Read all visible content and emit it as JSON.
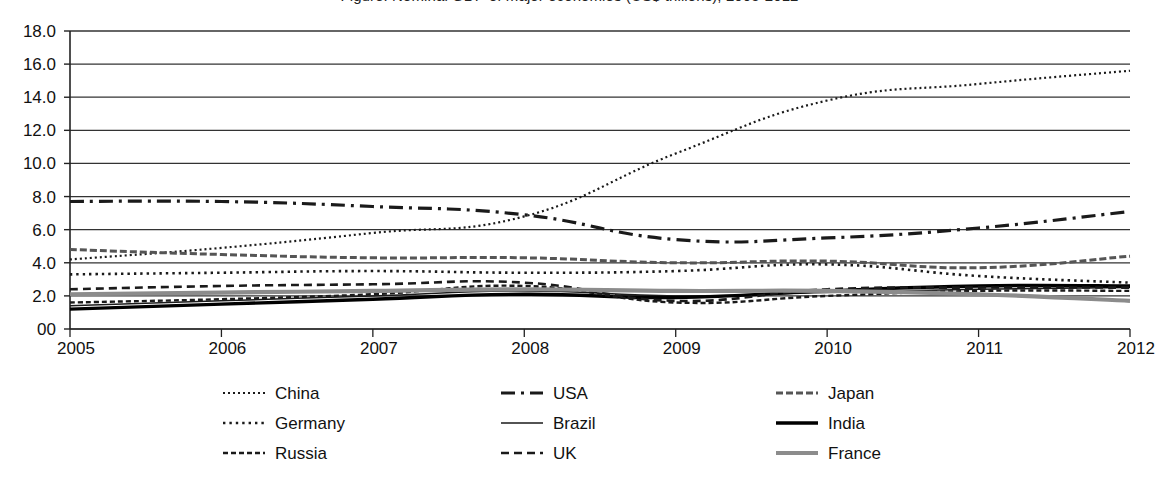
{
  "chart": {
    "title": "Figure: Nominal GDP of major economies (US$ trillions), 2005-2012",
    "yaxis": {
      "labels": [
        "18.0",
        "16.0",
        "14.0",
        "12.0",
        "10.0",
        "8.0",
        "6.0",
        "4.0",
        "2.0",
        "00"
      ],
      "values": [
        18,
        16,
        14,
        12,
        10,
        8,
        6,
        4,
        2,
        0
      ]
    },
    "xaxis": {
      "labels": [
        "2005",
        "2006",
        "2007",
        "2008",
        "2009",
        "2010",
        "2011",
        "2012"
      ]
    },
    "legend": {
      "columns": [
        {
          "items": [
            {
              "label": "China",
              "style": "fine-dotted",
              "color": "#1a1a1a"
            },
            {
              "label": "Germany",
              "style": "dotted",
              "color": "#1a1a1a"
            },
            {
              "label": "Russia",
              "style": "dash-short",
              "color": "#1a1a1a"
            }
          ]
        },
        {
          "items": [
            {
              "label": "USA",
              "style": "dash-dot",
              "color": "#1a1a1a"
            },
            {
              "label": "Brazil",
              "style": "solid-thin",
              "color": "#1a1a1a"
            },
            {
              "label": "UK",
              "style": "dashed",
              "color": "#1a1a1a"
            }
          ]
        },
        {
          "items": [
            {
              "label": "Japan",
              "style": "fine-dashed",
              "color": "#555555"
            },
            {
              "label": "India",
              "style": "solid-thick",
              "color": "#000000"
            },
            {
              "label": "France",
              "style": "solid-gray-thick",
              "color": "#8c8c8c"
            }
          ]
        }
      ]
    }
  },
  "chart_data": {
    "type": "line",
    "title": "Figure: Nominal GDP of major economies (US$ trillions), 2005-2012",
    "xlabel": "",
    "ylabel": "",
    "x": [
      2005,
      2006,
      2007,
      2008,
      2009,
      2010,
      2011,
      2012
    ],
    "categories": [
      "2005",
      "2006",
      "2007",
      "2008",
      "2009",
      "2010",
      "2011",
      "2012"
    ],
    "ylim": [
      0,
      18
    ],
    "xlim": [
      2005,
      2012
    ],
    "ytick_values": [
      0,
      2,
      4,
      6,
      8,
      10,
      12,
      14,
      16,
      18
    ],
    "grid": true,
    "legend_position": "bottom",
    "series": [
      {
        "name": "China",
        "style": "fine-dotted",
        "color": "#1a1a1a",
        "values": [
          4.2,
          4.9,
          5.8,
          6.8,
          10.6,
          13.8,
          14.8,
          15.6
        ]
      },
      {
        "name": "USA",
        "style": "dash-dot",
        "color": "#1a1a1a",
        "values": [
          7.7,
          7.7,
          7.4,
          6.9,
          5.4,
          5.5,
          6.1,
          7.1
        ]
      },
      {
        "name": "Japan",
        "style": "fine-dashed",
        "color": "#555555",
        "values": [
          4.8,
          4.5,
          4.3,
          4.3,
          4.0,
          4.1,
          3.7,
          4.4
        ]
      },
      {
        "name": "Germany",
        "style": "dotted",
        "color": "#1a1a1a",
        "values": [
          3.3,
          3.4,
          3.5,
          3.4,
          3.5,
          3.9,
          3.2,
          2.8
        ]
      },
      {
        "name": "Brazil",
        "style": "solid-thin",
        "color": "#1a1a1a",
        "values": [
          1.4,
          1.7,
          2.0,
          2.3,
          2.0,
          2.2,
          2.4,
          2.5
        ]
      },
      {
        "name": "India",
        "style": "solid-thick",
        "color": "#000000",
        "values": [
          1.2,
          1.5,
          1.8,
          2.1,
          1.9,
          2.3,
          2.6,
          2.6
        ]
      },
      {
        "name": "Russia",
        "style": "dash-short",
        "color": "#1a1a1a",
        "values": [
          1.6,
          1.8,
          2.1,
          2.6,
          1.6,
          2.0,
          2.3,
          2.3
        ]
      },
      {
        "name": "UK",
        "style": "dashed",
        "color": "#1a1a1a",
        "values": [
          2.4,
          2.6,
          2.7,
          2.8,
          1.7,
          2.4,
          2.5,
          2.5
        ]
      },
      {
        "name": "France",
        "style": "solid-gray-thick",
        "color": "#8c8c8c",
        "values": [
          2.1,
          2.2,
          2.3,
          2.4,
          2.3,
          2.3,
          2.1,
          1.7
        ]
      }
    ]
  }
}
